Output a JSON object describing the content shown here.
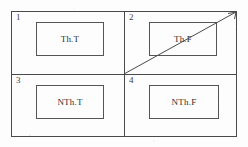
{
  "figure": {
    "type": "2x2-quadrant-matrix",
    "quadrants": [
      {
        "number": "1",
        "label": "Th.T"
      },
      {
        "number": "2",
        "label": "Th.F"
      },
      {
        "number": "3",
        "label": "NTh.T"
      },
      {
        "number": "4",
        "label": "NTh.F"
      }
    ],
    "diagonal": {
      "name": "diagonal-arrow",
      "from": "center-intersection",
      "to": "top-right-corner"
    },
    "colors": {
      "line": "#4a4a4a",
      "inner_box_line": "#555555",
      "text": "#2e2e2e",
      "background": "#fdfdfd"
    }
  }
}
